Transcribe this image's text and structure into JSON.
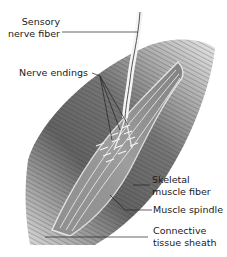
{
  "diagram": {
    "labels": [
      {
        "id": "sensory-nerve-fiber",
        "text": "Sensory\nnerve fiber"
      },
      {
        "id": "nerve-endings",
        "text": "Nerve endings"
      },
      {
        "id": "skeletal-muscle-fiber",
        "text": "Skeletal\nmuscle fiber"
      },
      {
        "id": "muscle-spindle",
        "text": "Muscle spindle"
      },
      {
        "id": "connective-tissue-sheath",
        "text": "Connective\ntissue sheath"
      }
    ],
    "colors": {
      "background": "#ffffff",
      "muscle_dark": "#3a3a3a",
      "muscle_mid": "#7a7a7a",
      "muscle_light": "#c8c8c8",
      "leader_line": "#222222"
    }
  }
}
